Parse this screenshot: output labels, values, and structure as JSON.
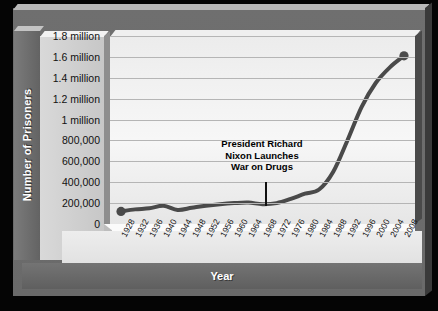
{
  "chart_data": {
    "type": "line",
    "title": "",
    "xlabel": "Year",
    "ylabel": "Number of Prisoners",
    "xlim": [
      1928,
      2008
    ],
    "ylim": [
      0,
      1800000
    ],
    "grid": true,
    "legend": null,
    "ytick_labels": [
      "0",
      "200,000",
      "400,000",
      "600,000",
      "800,000",
      "1 million",
      "1.2 million",
      "1.4 million",
      "1.6 million",
      "1.8 million"
    ],
    "ytick_values": [
      0,
      200000,
      400000,
      600000,
      800000,
      1000000,
      1200000,
      1400000,
      1600000,
      1800000
    ],
    "categories": [
      1928,
      1932,
      1936,
      1940,
      1944,
      1948,
      1952,
      1956,
      1960,
      1964,
      1968,
      1972,
      1976,
      1980,
      1984,
      1988,
      1992,
      1996,
      2000,
      2004,
      2008
    ],
    "values": [
      120000,
      140000,
      150000,
      175000,
      135000,
      155000,
      175000,
      190000,
      200000,
      205000,
      190000,
      200000,
      240000,
      290000,
      330000,
      500000,
      800000,
      1120000,
      1350000,
      1500000,
      1610000
    ],
    "series": [
      {
        "name": "Number of Prisoners",
        "values": [
          120000,
          140000,
          150000,
          175000,
          135000,
          155000,
          175000,
          190000,
          200000,
          205000,
          190000,
          200000,
          240000,
          290000,
          330000,
          500000,
          800000,
          1120000,
          1350000,
          1500000,
          1610000
        ]
      }
    ],
    "markers": [
      {
        "x": 1928,
        "y": 120000
      },
      {
        "x": 2008,
        "y": 1610000
      }
    ],
    "annotations": [
      {
        "text": "President Richard Nixon Launches War on Drugs",
        "lines": [
          "President Richard",
          "Nixon Launches",
          "War on Drugs"
        ],
        "x": 1971,
        "pointer": "vertical-line-to-curve"
      }
    ],
    "colors": {
      "line": "#4a4a4a",
      "marker": "#4a4a4a",
      "plot_background": "#efefef",
      "frame": "#6a6a6a",
      "page_background": "#000000",
      "gridline": "#b5b5b5",
      "axis_title_text": "#ffffff"
    }
  },
  "axis": {
    "y_title": "Number of Prisoners",
    "x_title": "Year"
  }
}
